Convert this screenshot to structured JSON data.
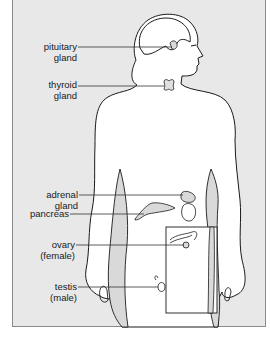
{
  "diagram": {
    "colors": {
      "panel_background": "#e8e8e8",
      "panel_border": "#8a8a8a",
      "body_fill": "#ffffff",
      "outline": "#1a1a1a",
      "gland_fill": "#d9d9d9",
      "leader_line": "#333333"
    },
    "labels": [
      {
        "id": "pituitary",
        "line1": "pituitary",
        "line2": "gland"
      },
      {
        "id": "thyroid",
        "line1": "thyroid",
        "line2": "gland"
      },
      {
        "id": "adrenal",
        "line1": "adrenal",
        "line2": "gland"
      },
      {
        "id": "pancreas",
        "line1": "pancreas",
        "line2": ""
      },
      {
        "id": "ovary",
        "line1": "ovary",
        "line2": "(female)"
      },
      {
        "id": "testis",
        "line1": "testis",
        "line2": "(male)"
      }
    ],
    "inset": {
      "description": "Inset box showing female reproductive organ (ovary)"
    }
  }
}
